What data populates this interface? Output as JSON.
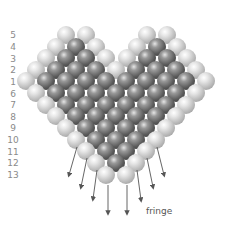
{
  "figure": {
    "row_labels": [
      {
        "label": "5",
        "y": 35
      },
      {
        "label": "4",
        "y": 47
      },
      {
        "label": "3",
        "y": 59
      },
      {
        "label": "2",
        "y": 70
      },
      {
        "label": "1",
        "y": 82
      },
      {
        "label": "6",
        "y": 94
      },
      {
        "label": "7",
        "y": 105
      },
      {
        "label": "8",
        "y": 117
      },
      {
        "label": "9",
        "y": 128
      },
      {
        "label": "10",
        "y": 140
      },
      {
        "label": "11",
        "y": 152
      },
      {
        "label": "12",
        "y": 163
      },
      {
        "label": "13",
        "y": 175
      }
    ],
    "rows": [
      {
        "row": "5",
        "y": 35,
        "x": [
          66,
          86,
          147,
          167
        ],
        "shade": [
          "light",
          "light",
          "light",
          "light"
        ]
      },
      {
        "row": "4",
        "y": 47,
        "x": [
          56,
          76,
          96,
          137,
          157,
          177
        ],
        "shade": [
          "light",
          "dark",
          "light",
          "light",
          "dark",
          "light"
        ]
      },
      {
        "row": "3",
        "y": 58,
        "x": [
          46,
          66,
          86,
          106,
          127,
          147,
          167,
          187
        ],
        "shade": [
          "light",
          "dark",
          "dark",
          "light",
          "light",
          "dark",
          "dark",
          "light"
        ]
      },
      {
        "row": "2",
        "y": 70,
        "x": [
          36,
          56,
          76,
          96,
          116,
          136,
          156,
          176,
          196
        ],
        "shade": [
          "light",
          "dark",
          "dark",
          "dark",
          "light",
          "dark",
          "dark",
          "dark",
          "light"
        ]
      },
      {
        "row": "1",
        "y": 81,
        "x": [
          26,
          46,
          66,
          86,
          106,
          126,
          146,
          166,
          186,
          206
        ],
        "shade": [
          "light",
          "dark",
          "dark",
          "dark",
          "dark",
          "dark",
          "dark",
          "dark",
          "dark",
          "light"
        ]
      },
      {
        "row": "6",
        "y": 93,
        "x": [
          36,
          56,
          76,
          96,
          116,
          136,
          156,
          176,
          196
        ],
        "shade": [
          "light",
          "dark",
          "dark",
          "dark",
          "dark",
          "dark",
          "dark",
          "dark",
          "light"
        ]
      },
      {
        "row": "7",
        "y": 105,
        "x": [
          46,
          66,
          86,
          106,
          126,
          146,
          166,
          186
        ],
        "shade": [
          "light",
          "dark",
          "dark",
          "dark",
          "dark",
          "dark",
          "dark",
          "light"
        ]
      },
      {
        "row": "8",
        "y": 116,
        "x": [
          56,
          76,
          96,
          116,
          136,
          156,
          176
        ],
        "shade": [
          "light",
          "dark",
          "dark",
          "dark",
          "dark",
          "dark",
          "light"
        ]
      },
      {
        "row": "9",
        "y": 128,
        "x": [
          66,
          86,
          106,
          126,
          146,
          166
        ],
        "shade": [
          "light",
          "dark",
          "dark",
          "dark",
          "dark",
          "light"
        ]
      },
      {
        "row": "10",
        "y": 140,
        "x": [
          76,
          96,
          116,
          136,
          156
        ],
        "shade": [
          "light",
          "dark",
          "dark",
          "dark",
          "light"
        ]
      },
      {
        "row": "11",
        "y": 151,
        "x": [
          86,
          106,
          126,
          146
        ],
        "shade": [
          "light",
          "dark",
          "dark",
          "light"
        ]
      },
      {
        "row": "12",
        "y": 163,
        "x": [
          96,
          116,
          136
        ],
        "shade": [
          "light",
          "dark",
          "light"
        ]
      },
      {
        "row": "13",
        "y": 175,
        "x": [
          106,
          126
        ],
        "shade": [
          "light",
          "light"
        ]
      }
    ],
    "arrows": [
      {
        "x1": 77,
        "y1": 147,
        "x2": 69,
        "y2": 175
      },
      {
        "x1": 87,
        "y1": 158,
        "x2": 81,
        "y2": 187
      },
      {
        "x1": 97,
        "y1": 170,
        "x2": 93,
        "y2": 199
      },
      {
        "x1": 108,
        "y1": 185,
        "x2": 108,
        "y2": 213
      },
      {
        "x1": 127,
        "y1": 185,
        "x2": 127,
        "y2": 213
      },
      {
        "x1": 137,
        "y1": 170,
        "x2": 141,
        "y2": 200
      },
      {
        "x1": 147,
        "y1": 158,
        "x2": 153,
        "y2": 187
      },
      {
        "x1": 157,
        "y1": 147,
        "x2": 164,
        "y2": 175
      }
    ],
    "fringe_label": "fringe",
    "colors": {
      "light_bead": "#c8c8c8",
      "dark_bead": "#4a4a4a",
      "arrow": "#555555",
      "label": "#8a8a8a"
    }
  }
}
